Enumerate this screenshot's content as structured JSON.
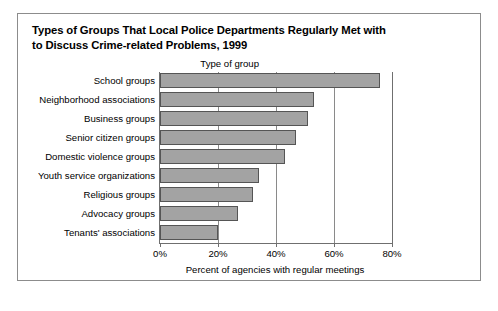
{
  "panel": {
    "title_line1": "Types of Groups That Local Police Departments Regularly Met with",
    "title_line2": "to Discuss Crime-related Problems, 1999",
    "border_color": "#8c8c8c"
  },
  "chart_data": {
    "type": "bar",
    "orientation": "horizontal",
    "title": "Types of Groups That Local Police Departments Regularly Met with to Discuss Crime-related Problems, 1999",
    "subtitle": "",
    "category_axis_title": "Type of group",
    "xlabel": "Percent of agencies with regular meetings",
    "ylabel": "Type of group",
    "categories": [
      "School groups",
      "Neighborhood associations",
      "Business groups",
      "Senior citizen groups",
      "Domestic violence groups",
      "Youth service organizations",
      "Religious groups",
      "Advocacy groups",
      "Tenants' associations"
    ],
    "values": [
      76,
      53,
      51,
      47,
      43,
      34,
      32,
      27,
      20
    ],
    "value_unit": "%",
    "xlim": [
      0,
      80
    ],
    "xticks": [
      0,
      20,
      40,
      60,
      80
    ],
    "xtick_labels": [
      "0%",
      "20%",
      "40%",
      "60%",
      "80%"
    ],
    "grid": true,
    "grid_axis": "x",
    "legend": false,
    "legend_position": "none",
    "bar_color": "#a3a3a3",
    "bar_edge_color": "#555555",
    "axis_color": "#6f6f6f",
    "background_color": "#ffffff",
    "annotations": []
  }
}
